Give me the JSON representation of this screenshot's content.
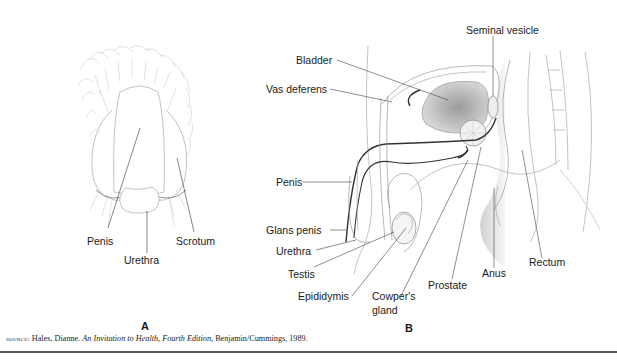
{
  "figure_a": {
    "panel_label": "A",
    "labels": {
      "penis": "Penis",
      "urethra": "Urethra",
      "scrotum": "Scrotum"
    }
  },
  "figure_b": {
    "panel_label": "B",
    "labels": {
      "seminal_vesicle": "Seminal vesicle",
      "bladder": "Bladder",
      "vas_deferens": "Vas deferens",
      "penis": "Penis",
      "glans_penis": "Glans penis",
      "urethra": "Urethra",
      "testis": "Testis",
      "epididymis": "Epididymis",
      "cowpers_gland_line1": "Cowper's",
      "cowpers_gland_line2": "gland",
      "prostate": "Prostate",
      "anus": "Anus",
      "rectum": "Rectum"
    }
  },
  "source": {
    "prefix": "source:",
    "author": "Hales, Dianne. ",
    "title": "An Invitation to Health, Fourth Edition,",
    "publisher": " Benjamin/Cummings, 1989."
  },
  "colors": {
    "line": "#333333",
    "outline": "#9a9a9a",
    "shade": "#b8b8b8",
    "rule": "#555555"
  }
}
